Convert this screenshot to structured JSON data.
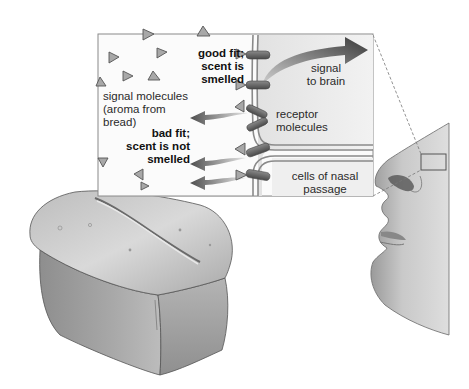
{
  "figure": {
    "inset": {
      "labels": {
        "good_fit": "good fit;\nscent is\nsmelled",
        "bad_fit": "bad fit;\nscent is not\nsmelled",
        "signal_molecules": "signal molecules\n(aroma from\nbread)",
        "signal_to_brain": "signal\nto brain",
        "receptor_molecules": "receptor\nmolecules",
        "cells_nasal_passage": "cells of nasal\npassage"
      }
    },
    "illustrations": {
      "bread": "loaf-of-bread",
      "face": "human-face-profile",
      "callout": "nose-callout-box"
    },
    "colors": {
      "background": "#ffffff",
      "inset_fill": "#fbfbfb",
      "cell_fill": "#ececec",
      "membrane": "#8a8a8a",
      "arrow": "#5a5a5a",
      "molecule": "#9a9a9a",
      "text": "#222222"
    }
  }
}
